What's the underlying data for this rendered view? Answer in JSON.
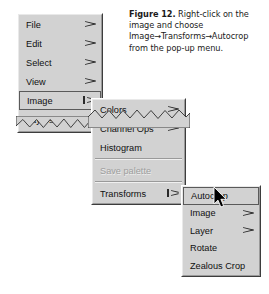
{
  "caption": {
    "figure_label": "Figure 12.",
    "text_1": " Right-click on the image and choose Image",
    "arrow_1": "→",
    "text_2": "Transforms",
    "arrow_2": "→",
    "text_3": "Autocrop from the pop-up menu."
  },
  "colors": {
    "menu_background": "#d2d2d2",
    "menu_text": "#101010",
    "menu_text_disabled": "#9d9d9d",
    "menu_border_dark": "#3d3d3d",
    "menu_border_light": "#ffffff",
    "page_background": "#ffffff",
    "cursor": "#000000"
  },
  "menus": {
    "main": {
      "name": "main-menu",
      "items": [
        {
          "label": "File",
          "submenu": true,
          "disabled": false,
          "selected": false,
          "open": false
        },
        {
          "label": "Edit",
          "submenu": true,
          "disabled": false,
          "selected": false,
          "open": false
        },
        {
          "label": "Select",
          "submenu": true,
          "disabled": false,
          "selected": false,
          "open": false
        },
        {
          "label": "View",
          "submenu": true,
          "disabled": false,
          "selected": false,
          "open": false
        },
        {
          "label": "Image",
          "submenu": true,
          "disabled": false,
          "selected": true,
          "open": true
        },
        {
          "label": "Layers",
          "submenu": true,
          "disabled": false,
          "selected": false,
          "open": false
        }
      ]
    },
    "image": {
      "name": "image-submenu",
      "items": [
        {
          "label": "Colors",
          "submenu": true,
          "disabled": false,
          "selected": false,
          "open": false
        },
        {
          "label": "Channel Ops",
          "submenu": true,
          "disabled": false,
          "selected": false,
          "open": false
        },
        {
          "label": "Histogram",
          "submenu": false,
          "disabled": false,
          "selected": false,
          "open": false
        },
        {
          "label": "Save palette",
          "submenu": false,
          "disabled": true,
          "selected": false,
          "open": false
        },
        {
          "label": "Transforms",
          "submenu": true,
          "disabled": false,
          "selected": false,
          "open": true
        }
      ]
    },
    "transforms": {
      "name": "transforms-submenu",
      "items": [
        {
          "label": "Autocrop",
          "submenu": false,
          "disabled": false,
          "selected": true,
          "open": false
        },
        {
          "label": "Image",
          "submenu": true,
          "disabled": false,
          "selected": false,
          "open": false
        },
        {
          "label": "Layer",
          "submenu": true,
          "disabled": false,
          "selected": false,
          "open": false
        },
        {
          "label": "Rotate",
          "submenu": false,
          "disabled": false,
          "selected": false,
          "open": false
        },
        {
          "label": "Zealous Crop",
          "submenu": false,
          "disabled": false,
          "selected": false,
          "open": false
        }
      ]
    }
  },
  "cursor": {
    "icon": "mouse-pointer-icon"
  }
}
